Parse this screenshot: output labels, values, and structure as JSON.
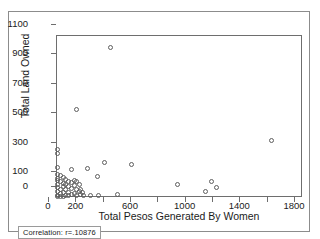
{
  "page": {
    "top_bleed_text": "······························",
    "correlation_label": "Correlation: r=.10876"
  },
  "chart_data": {
    "type": "scatter",
    "title": "",
    "xlabel": "Total Pesos Generated By Women",
    "ylabel": "Total Land Owned",
    "xlim": [
      0,
      1800
    ],
    "ylim": [
      0,
      1100
    ],
    "grid": false,
    "legend": null,
    "marker": "open-circle",
    "marker_color": "#5e5e5e",
    "xticks": [
      0,
      200,
      400,
      600,
      800,
      1000,
      1200,
      1400,
      1600,
      1800
    ],
    "xticklabels": [
      "0",
      "200",
      "",
      "600",
      "",
      "1000",
      "",
      "1400",
      "",
      "1800"
    ],
    "yticks": [
      0,
      100,
      300,
      500,
      700,
      900,
      1100
    ],
    "yticklabels": [
      "0",
      "100",
      "300",
      "500",
      "700",
      "900",
      "1100"
    ],
    "annotations": [
      {
        "text": "Correlation: r=.10876",
        "position": "bottom-left"
      }
    ],
    "points": [
      {
        "x": 5,
        "y": 330
      },
      {
        "x": 5,
        "y": 300
      },
      {
        "x": 5,
        "y": 205
      },
      {
        "x": 5,
        "y": 160
      },
      {
        "x": 5,
        "y": 135
      },
      {
        "x": 5,
        "y": 120
      },
      {
        "x": 5,
        "y": 95
      },
      {
        "x": 5,
        "y": 70
      },
      {
        "x": 5,
        "y": 45
      },
      {
        "x": 5,
        "y": 20
      },
      {
        "x": 5,
        "y": 8
      },
      {
        "x": 25,
        "y": 150
      },
      {
        "x": 25,
        "y": 110
      },
      {
        "x": 25,
        "y": 60
      },
      {
        "x": 25,
        "y": 30
      },
      {
        "x": 25,
        "y": 10
      },
      {
        "x": 45,
        "y": 140
      },
      {
        "x": 45,
        "y": 100
      },
      {
        "x": 45,
        "y": 75
      },
      {
        "x": 45,
        "y": 35
      },
      {
        "x": 45,
        "y": 12
      },
      {
        "x": 65,
        "y": 125
      },
      {
        "x": 65,
        "y": 90
      },
      {
        "x": 65,
        "y": 55
      },
      {
        "x": 65,
        "y": 18
      },
      {
        "x": 85,
        "y": 115
      },
      {
        "x": 85,
        "y": 80
      },
      {
        "x": 85,
        "y": 40
      },
      {
        "x": 85,
        "y": 15
      },
      {
        "x": 105,
        "y": 195
      },
      {
        "x": 105,
        "y": 105
      },
      {
        "x": 105,
        "y": 65
      },
      {
        "x": 105,
        "y": 22
      },
      {
        "x": 125,
        "y": 120
      },
      {
        "x": 125,
        "y": 85
      },
      {
        "x": 125,
        "y": 30
      },
      {
        "x": 145,
        "y": 600
      },
      {
        "x": 145,
        "y": 110
      },
      {
        "x": 145,
        "y": 55
      },
      {
        "x": 145,
        "y": 18
      },
      {
        "x": 165,
        "y": 95
      },
      {
        "x": 165,
        "y": 45
      },
      {
        "x": 175,
        "y": 60
      },
      {
        "x": 175,
        "y": 25
      },
      {
        "x": 185,
        "y": 40
      },
      {
        "x": 195,
        "y": 15
      },
      {
        "x": 225,
        "y": 200
      },
      {
        "x": 245,
        "y": 20
      },
      {
        "x": 295,
        "y": 145
      },
      {
        "x": 305,
        "y": 20
      },
      {
        "x": 345,
        "y": 240
      },
      {
        "x": 390,
        "y": 1020
      },
      {
        "x": 445,
        "y": 22
      },
      {
        "x": 545,
        "y": 230
      },
      {
        "x": 880,
        "y": 95
      },
      {
        "x": 1090,
        "y": 45
      },
      {
        "x": 1130,
        "y": 115
      },
      {
        "x": 1165,
        "y": 70
      },
      {
        "x": 1570,
        "y": 390
      }
    ]
  }
}
